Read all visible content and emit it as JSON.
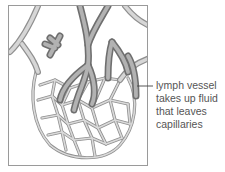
{
  "diagram": {
    "label": {
      "lines": [
        "lymph vessel",
        "takes up fluid",
        "that leaves",
        "capillaries"
      ]
    },
    "colors": {
      "frame": "#9a9a9a",
      "capillary": "#c8c8c8",
      "capillary_outline": "#8f8f8f",
      "lymph_vessel": "#9e9e9e",
      "lymph_vessel_dark": "#7a7a7a",
      "leader_line": "#444444",
      "text": "#555555"
    }
  }
}
